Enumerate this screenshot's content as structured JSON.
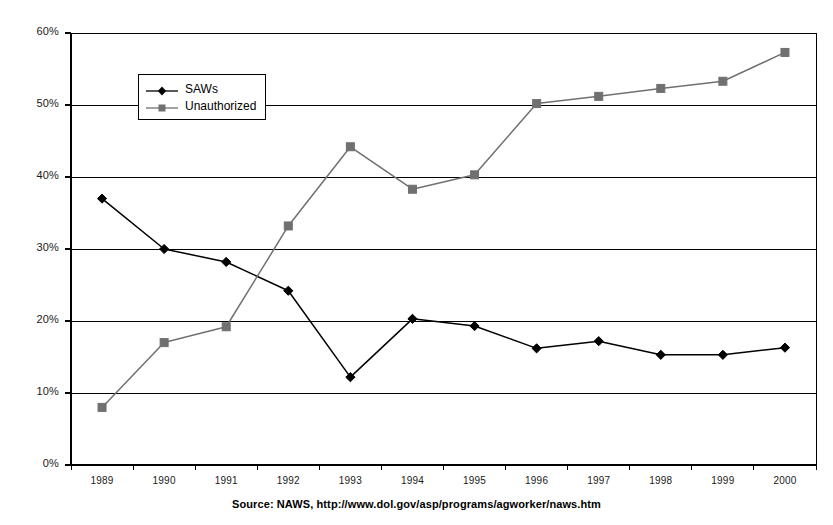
{
  "chart_data": {
    "type": "line",
    "title": "",
    "xlabel": "",
    "ylabel": "",
    "categories": [
      "1989",
      "1990",
      "1991",
      "1992",
      "1993",
      "1994",
      "1995",
      "1996",
      "1997",
      "1998",
      "1999",
      "2000"
    ],
    "ylim": [
      0,
      60
    ],
    "ytick_labels": [
      "0%",
      "10%",
      "20%",
      "30%",
      "40%",
      "50%",
      "60%"
    ],
    "ytick_values": [
      0,
      10,
      20,
      30,
      40,
      50,
      60
    ],
    "grid": true,
    "legend_position": "upper-left-inside",
    "series": [
      {
        "name": "SAWs",
        "marker": "diamond",
        "color": "#000000",
        "values": [
          37.0,
          30.0,
          28.2,
          24.2,
          12.2,
          20.3,
          19.3,
          16.2,
          17.2,
          15.3,
          15.3,
          16.3
        ]
      },
      {
        "name": "Unauthorized",
        "marker": "square",
        "color": "#707070",
        "values": [
          8.0,
          17.0,
          19.2,
          33.2,
          44.2,
          38.3,
          40.3,
          50.2,
          51.2,
          52.3,
          53.3,
          57.3
        ]
      }
    ],
    "annotations": []
  },
  "caption": {
    "source_text": "Source: NAWS, http://www.dol.gov/asp/programs/agworker/naws.htm"
  },
  "legend": {
    "entries": [
      {
        "label": "SAWs"
      },
      {
        "label": "Unauthorized"
      }
    ]
  },
  "colors": {
    "saws": "#000000",
    "unauthorized": "#707070",
    "axis": "#000000",
    "grid": "#000000",
    "background": "#ffffff"
  }
}
